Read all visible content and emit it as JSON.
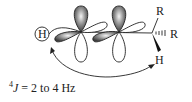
{
  "diagram": {
    "labels": {
      "h_left": "H",
      "r_top": "R",
      "r_hashed": "R",
      "h_wedge": "H"
    },
    "caption": {
      "superscript": "4",
      "symbol": "J",
      "text": " = 2 to 4 Hz"
    },
    "colors": {
      "line": "#222222",
      "lobe_dark": "#555555",
      "lobe_light": "#ffffff"
    }
  }
}
